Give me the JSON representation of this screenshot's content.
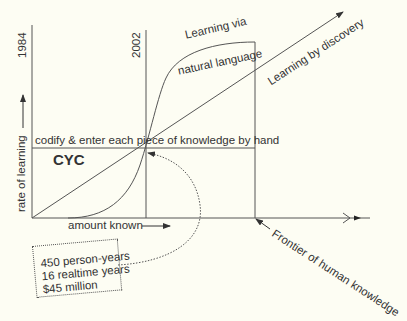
{
  "diagram": {
    "y_axis_label": "rate of learning",
    "x_axis_label": "amount known",
    "year_start": "1984",
    "year_mid": "2002",
    "labels": {
      "codify": "codify & enter each piece of knowledge by hand",
      "cyc": "CYC",
      "nl_line1": "Learning via",
      "nl_line2": "natural language",
      "discovery": "Learning by discovery",
      "frontier": "Frontier of human knowledge"
    },
    "cost_box": {
      "lines": [
        "450 person-years",
        "16 realtime years",
        "$45 million"
      ]
    },
    "colors": {
      "background": "#fdfdf3",
      "ink": "#444444"
    }
  }
}
